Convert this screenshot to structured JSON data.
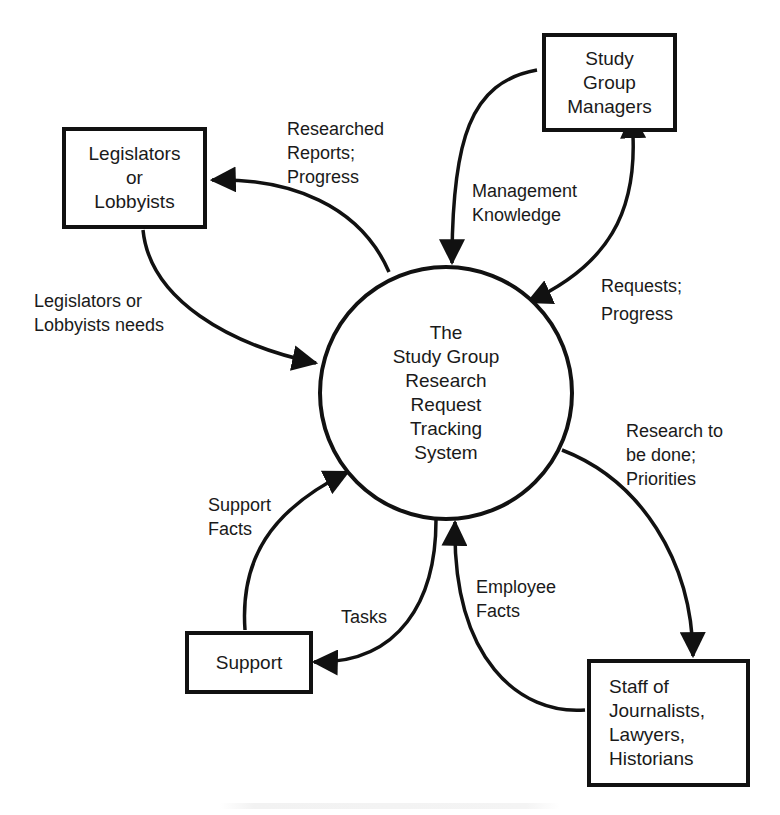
{
  "diagram": {
    "type": "context data-flow diagram",
    "process": {
      "lines": [
        "The",
        "Study Group",
        "Research",
        "Request",
        "Tracking",
        "System"
      ]
    },
    "entities": {
      "legislators": {
        "lines": [
          "Legislators",
          "or",
          "Lobbyists"
        ]
      },
      "managers": {
        "lines": [
          "Study",
          "Group",
          "Managers"
        ]
      },
      "support": {
        "lines": [
          "Support"
        ]
      },
      "staff": {
        "lines": [
          "Staff of",
          "Journalists,",
          "Lawyers,",
          "Historians"
        ]
      }
    },
    "flows": {
      "researched_reports": {
        "lines": [
          "Researched",
          "Reports;",
          "Progress"
        ],
        "from": "process",
        "to": "legislators"
      },
      "legislators_needs": {
        "lines": [
          "Legislators or",
          "Lobbyists needs"
        ],
        "from": "legislators",
        "to": "process"
      },
      "management_knowledge": {
        "lines": [
          "Management",
          "Knowledge"
        ],
        "from": "managers",
        "to": "process"
      },
      "requests_progress": {
        "lines": [
          "Requests;",
          "Progress"
        ],
        "from": "managers",
        "to": "process",
        "bidirectional": true
      },
      "research_to_be_done": {
        "lines": [
          "Research to",
          "be done;",
          "Priorities"
        ],
        "from": "process",
        "to": "staff"
      },
      "employee_facts": {
        "lines": [
          "Employee",
          "Facts"
        ],
        "from": "staff",
        "to": "process"
      },
      "support_facts": {
        "lines": [
          "Support",
          "Facts"
        ],
        "from": "support",
        "to": "process"
      },
      "tasks": {
        "lines": [
          "Tasks"
        ],
        "from": "process",
        "to": "support"
      }
    },
    "caption": {
      "text": ""
    },
    "colors": {
      "stroke": "#111111",
      "background": "#ffffff",
      "text": "#1a1a1a"
    }
  }
}
